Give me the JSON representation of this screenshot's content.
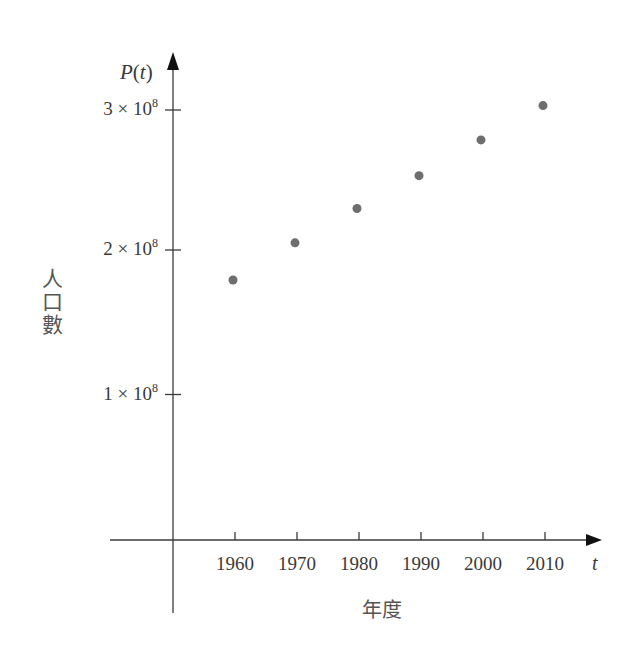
{
  "chart_data": {
    "type": "scatter",
    "title": "",
    "xlabel": "年度",
    "ylabel": "人口數",
    "x_axis_symbol": "t",
    "y_axis_symbol": "P(t)",
    "x": [
      1960,
      1970,
      1980,
      1990,
      2000,
      2010
    ],
    "values": [
      179000000,
      205000000,
      229000000,
      252000000,
      277000000,
      301000000
    ],
    "series": [
      {
        "name": "P(t)",
        "x": [
          1960,
          1970,
          1980,
          1990,
          2000,
          2010
        ],
        "values": [
          179000000,
          205000000,
          229000000,
          252000000,
          277000000,
          301000000
        ]
      }
    ],
    "x_ticks": [
      "1960",
      "1970",
      "1980",
      "1990",
      "2000",
      "2010"
    ],
    "y_ticks": [
      {
        "value": 100000000,
        "label_base": "1 × 10",
        "label_exp": "8"
      },
      {
        "value": 200000000,
        "label_base": "2 × 10",
        "label_exp": "8"
      },
      {
        "value": 300000000,
        "label_base": "3 × 10",
        "label_exp": "8"
      }
    ],
    "ylim": [
      0,
      330000000
    ],
    "xlim": [
      1950,
      2020
    ],
    "grid": false,
    "legend": "none",
    "marker_color": "#6e6e6e",
    "axis_color": "#3a3a3a"
  },
  "labels": {
    "y_symbol_main": "P",
    "y_symbol_arg": "(t)",
    "x_symbol": "t",
    "ytitle_chars": [
      "人",
      "口",
      "數"
    ],
    "xtitle": "年度"
  }
}
